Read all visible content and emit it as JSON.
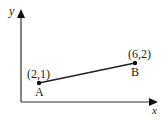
{
  "diagram": {
    "axes": {
      "x_label": "x",
      "y_label": "y"
    },
    "points": [
      {
        "name": "A",
        "coord_label": "(2,1)",
        "x": 2,
        "y": 1
      },
      {
        "name": "B",
        "coord_label": "(6,2)",
        "x": 6,
        "y": 2
      }
    ],
    "segment": {
      "from": "A",
      "to": "B"
    },
    "colors": {
      "line": "#222222",
      "axis": "#333333"
    }
  }
}
